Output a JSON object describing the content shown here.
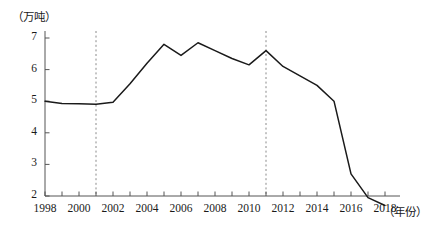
{
  "chart_data": {
    "type": "line",
    "title": "",
    "subtitle": "",
    "xlabel": "（年份）",
    "ylabel": "（万吨）",
    "x": [
      1998,
      1999,
      2000,
      2001,
      2002,
      2003,
      2004,
      2005,
      2006,
      2007,
      2008,
      2009,
      2010,
      2011,
      2012,
      2013,
      2014,
      2015,
      2016,
      2017,
      2018
    ],
    "values": [
      5.0,
      4.93,
      4.92,
      4.9,
      4.97,
      5.55,
      6.2,
      6.8,
      6.45,
      6.85,
      6.6,
      6.35,
      6.15,
      6.6,
      6.1,
      5.8,
      5.5,
      5.0,
      2.7,
      1.95,
      1.7
    ],
    "series": [
      {
        "name": "产量",
        "values": [
          5.0,
          4.93,
          4.92,
          4.9,
          4.97,
          5.55,
          6.2,
          6.8,
          6.45,
          6.85,
          6.6,
          6.35,
          6.15,
          6.6,
          6.1,
          5.8,
          5.5,
          5.0,
          2.7,
          1.95,
          1.7
        ],
        "color": "#1a1a1a"
      }
    ],
    "xlim": [
      1998,
      2018
    ],
    "ylim": [
      1.55,
      7.3
    ],
    "ytick_values": [
      2,
      3,
      4,
      5,
      6,
      7
    ],
    "ytick_labels": [
      "2",
      "3",
      "4",
      "5",
      "6",
      "7"
    ],
    "xtick_values": [
      1998,
      2000,
      2002,
      2004,
      2006,
      2008,
      2010,
      2012,
      2014,
      2016,
      2018
    ],
    "xtick_labels": [
      "1998",
      "2000",
      "2002",
      "2004",
      "2006",
      "2008",
      "2010",
      "2012",
      "2014",
      "2016",
      "2018"
    ],
    "xtick_minor_values": [
      1999,
      2001,
      2003,
      2005,
      2007,
      2009,
      2011,
      2013,
      2015,
      2017
    ],
    "grid": false,
    "legend": "none",
    "annotations": [
      {
        "type": "vertical-dashed-line",
        "x": 2001,
        "color": "#8a8a8a"
      },
      {
        "type": "vertical-dashed-line",
        "x": 2011,
        "color": "#8a8a8a"
      }
    ],
    "axis_color": "#555555",
    "line_color": "#1a1a1a"
  }
}
